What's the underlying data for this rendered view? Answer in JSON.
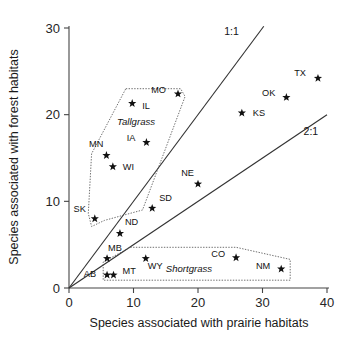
{
  "chart_data": {
    "type": "scatter",
    "title": "",
    "xlabel": "Species associated with prairie habitats",
    "ylabel": "Species associated with forest habitats",
    "xlim": [
      0,
      40
    ],
    "ylim": [
      0,
      30
    ],
    "xticks": [
      0,
      10,
      20,
      30,
      40
    ],
    "yticks": [
      0,
      10,
      20,
      30
    ],
    "grid": false,
    "legend": "none",
    "marker": "star",
    "points": [
      {
        "label": "SK",
        "x": 4.0,
        "y": 8.0,
        "label_dx": -9,
        "label_dy": -7
      },
      {
        "label": "MN",
        "x": 5.8,
        "y": 15.3,
        "label_dx": -3,
        "label_dy": -8
      },
      {
        "label": "WI",
        "x": 6.8,
        "y": 14.0,
        "label_dx": 10,
        "label_dy": 3
      },
      {
        "label": "IL",
        "x": 9.8,
        "y": 21.3,
        "label_dx": 10,
        "label_dy": 6
      },
      {
        "label": "IA",
        "x": 12.0,
        "y": 16.8,
        "label_dx": -11,
        "label_dy": -1
      },
      {
        "label": "MO",
        "x": 16.9,
        "y": 22.4,
        "label_dx": -12,
        "label_dy": -1
      },
      {
        "label": "ND",
        "x": 7.9,
        "y": 6.3,
        "label_dx": 5,
        "label_dy": -8
      },
      {
        "label": "SD",
        "x": 12.9,
        "y": 9.2,
        "label_dx": 7,
        "label_dy": -7
      },
      {
        "label": "NE",
        "x": 20.0,
        "y": 12.0,
        "label_dx": -4,
        "label_dy": -8
      },
      {
        "label": "KS",
        "x": 26.8,
        "y": 20.2,
        "label_dx": 11,
        "label_dy": 3
      },
      {
        "label": "OK",
        "x": 33.7,
        "y": 22.0,
        "label_dx": -11,
        "label_dy": -1
      },
      {
        "label": "TX",
        "x": 38.6,
        "y": 24.2,
        "label_dx": -12,
        "label_dy": -2
      },
      {
        "label": "MB",
        "x": 5.9,
        "y": 3.4,
        "label_dx": 1,
        "label_dy": -8
      },
      {
        "label": "AB",
        "x": 5.9,
        "y": 1.5,
        "label_dx": -11,
        "label_dy": 2
      },
      {
        "label": "MT",
        "x": 6.9,
        "y": 1.5,
        "label_dx": 9,
        "label_dy": -1
      },
      {
        "label": "WY",
        "x": 11.9,
        "y": 3.4,
        "label_dx": 2,
        "label_dy": 10
      },
      {
        "label": "CO",
        "x": 25.9,
        "y": 3.5,
        "label_dx": -11,
        "label_dy": -1
      },
      {
        "label": "NM",
        "x": 32.9,
        "y": 2.2,
        "label_dx": -11,
        "label_dy": 0
      }
    ],
    "reference_lines": [
      {
        "name": "1:1",
        "slope": 1.0,
        "label": "1:1",
        "x_from": 0,
        "x_to": 30.2,
        "label_x": 25.2,
        "label_y": 29.6
      },
      {
        "name": "2:1",
        "slope": 0.5,
        "label": "2:1",
        "x_from": 0,
        "x_to": 40.0,
        "label_x": 37.5,
        "label_y": 18.1
      }
    ],
    "regions": [
      {
        "name": "Tallgrass",
        "label": "Tallgrass",
        "label_x": 10.4,
        "label_y": 19.2,
        "vertices": [
          [
            8.8,
            23.0
          ],
          [
            17.3,
            23.0
          ],
          [
            18.0,
            22.1
          ],
          [
            11.4,
            9.0
          ],
          [
            5.5,
            7.8
          ],
          [
            3.5,
            7.1
          ],
          [
            3.0,
            8.6
          ],
          [
            3.5,
            15.5
          ]
        ]
      },
      {
        "name": "Shortgrass",
        "label": "Shortgrass",
        "label_x": 18.6,
        "label_y": 2.3,
        "vertices": [
          [
            9.5,
            4.7
          ],
          [
            25.9,
            4.7
          ],
          [
            34.3,
            3.3
          ],
          [
            34.3,
            0.9
          ],
          [
            5.3,
            0.9
          ],
          [
            5.3,
            3.0
          ]
        ]
      }
    ]
  },
  "axes": {
    "x_tick_labels": [
      "0",
      "10",
      "20",
      "30",
      "40"
    ],
    "y_tick_labels": [
      "0",
      "10",
      "20",
      "30"
    ],
    "x_title": "Species associated with prairie habitats",
    "y_title": "Species associated with forest habitats"
  }
}
